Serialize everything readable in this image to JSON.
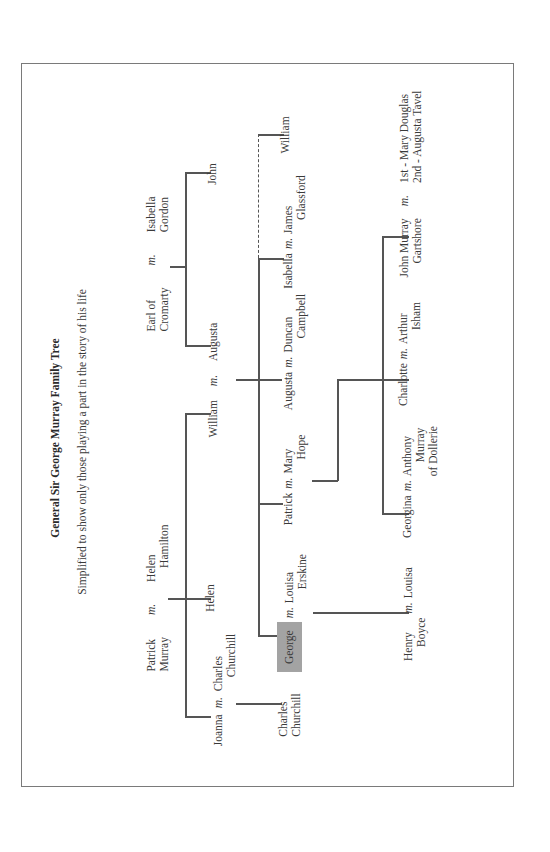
{
  "title": "General Sir George Murray Family Tree",
  "subtitle": "Simplified to show only those playing a part in the story of his life",
  "marriage_marker": "m.",
  "highlight_color": "#a3a3a3",
  "generation1": {
    "murray": {
      "husband": [
        "Patrick",
        "Murray"
      ],
      "wife": [
        "Helen",
        "Hamilton"
      ]
    },
    "cromarty": {
      "husband": [
        "Earl of",
        "Cromarty"
      ],
      "wife": [
        "Isabella",
        "Gordon"
      ]
    }
  },
  "generation2": {
    "joanna": {
      "name": "Joanna",
      "spouse": [
        "Charles",
        "Churchill"
      ]
    },
    "helen": {
      "name": "Helen"
    },
    "william": {
      "name": "William",
      "spouse": "Augusta"
    },
    "john": {
      "name": "John"
    }
  },
  "generation3": {
    "charles": {
      "name": [
        "Charles",
        "Churchill"
      ]
    },
    "george": {
      "name": "George",
      "spouse": [
        "Louisa",
        "Erskine"
      ],
      "highlighted": true
    },
    "patrick": {
      "name": "Patrick",
      "spouse": [
        "Mary",
        "Hope"
      ]
    },
    "augusta": {
      "name": "Augusta",
      "spouse": [
        "Duncan",
        "Campbell"
      ]
    },
    "isabella": {
      "name": "Isabella",
      "spouse": [
        "James",
        "Glassford"
      ]
    },
    "william": {
      "name": "William"
    }
  },
  "generation4": {
    "henry": {
      "name": [
        "Henry",
        "Boyce"
      ],
      "spouse": "Louisa"
    },
    "georgina": {
      "name": "Georgina",
      "spouse": [
        "Anthony",
        "Murray",
        "of Dollerie"
      ]
    },
    "charlotte": {
      "name": "Charlotte",
      "spouse": [
        "Arthur",
        "Isham"
      ]
    },
    "john_murray": {
      "name": [
        "John Murray",
        "Gartshore"
      ],
      "spouses": [
        "1st - Mary Douglas",
        "2nd - Augusta Tavel"
      ]
    }
  }
}
